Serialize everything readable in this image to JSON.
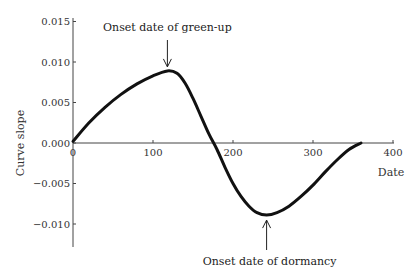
{
  "chart_data": {
    "type": "line",
    "title": "",
    "xlabel": "Date",
    "ylabel": "Curve slope",
    "xlim": [
      0,
      400
    ],
    "ylim": [
      -0.013,
      0.015
    ],
    "grid": false,
    "legend": null,
    "x_ticks": [
      0,
      100,
      200,
      300,
      400
    ],
    "x_tick_labels": [
      "0",
      "100",
      "200",
      "300",
      "400"
    ],
    "y_ticks": [
      0.015,
      0.01,
      0.005,
      0.0,
      -0.005,
      -0.01
    ],
    "y_tick_labels": [
      "0.015",
      "0.010",
      "0.005",
      "0.000",
      "−0.005",
      "−0.010"
    ],
    "series": [
      {
        "name": "Curve slope",
        "color": "#111111",
        "x": [
          0,
          20,
          40,
          60,
          80,
          100,
          118,
          130,
          140,
          150,
          160,
          170,
          180,
          190,
          200,
          210,
          220,
          230,
          242,
          255,
          270,
          285,
          300,
          315,
          330,
          345,
          360
        ],
        "values": [
          0.0002,
          0.0025,
          0.0044,
          0.006,
          0.0073,
          0.0083,
          0.0089,
          0.0086,
          0.0074,
          0.0055,
          0.0033,
          0.0011,
          -0.0008,
          -0.003,
          -0.005,
          -0.0066,
          -0.0078,
          -0.0086,
          -0.0089,
          -0.0086,
          -0.0078,
          -0.0066,
          -0.0052,
          -0.0036,
          -0.0021,
          -0.0008,
          0.0
        ]
      }
    ],
    "annotations": [
      {
        "text": "Onset date of green-up",
        "x": 118,
        "y": 0.0089,
        "arrow": "down"
      },
      {
        "text": "Onset date of dormancy",
        "x": 242,
        "y": -0.0089,
        "arrow": "up"
      }
    ]
  }
}
